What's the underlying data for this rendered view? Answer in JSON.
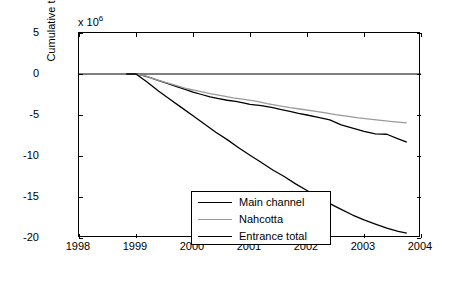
{
  "chart_data": {
    "type": "line",
    "title": "",
    "xlabel": "",
    "ylabel": "Cumulative transport (m",
    "ylabel_sup": "3",
    "ylabel_tail": ")",
    "y_exponent_prefix": "x 10",
    "y_exponent": "6",
    "xlim": [
      1998,
      2004
    ],
    "ylim": [
      -20,
      5
    ],
    "xticks": [
      "1998",
      "1999",
      "2000",
      "2001",
      "2002",
      "2003",
      "2004"
    ],
    "yticks": [
      "5",
      "0",
      "-5",
      "-10",
      "-15",
      "-20"
    ],
    "grid": false,
    "legend_position": "lower-left-inside",
    "series": [
      {
        "name": "Main channel",
        "color": "#000000",
        "x": [
          1998.83,
          1999.0,
          1999.1,
          1999.25,
          1999.4,
          1999.55,
          1999.7,
          1999.85,
          2000.0,
          2000.15,
          2000.3,
          2000.45,
          2000.6,
          2000.75,
          2000.9,
          2001.0,
          2001.2,
          2001.4,
          2001.55,
          2001.7,
          2001.85,
          2002.0,
          2002.2,
          2002.4,
          2002.6,
          2002.8,
          2003.0,
          2003.2,
          2003.4,
          2003.6,
          2003.75
        ],
        "y": [
          0.0,
          0.0,
          -0.15,
          -0.45,
          -0.8,
          -1.15,
          -1.5,
          -1.85,
          -2.2,
          -2.5,
          -2.8,
          -3.0,
          -3.2,
          -3.35,
          -3.55,
          -3.7,
          -3.85,
          -4.1,
          -4.35,
          -4.55,
          -4.8,
          -5.0,
          -5.3,
          -5.6,
          -6.2,
          -6.6,
          -7.0,
          -7.3,
          -7.35,
          -7.9,
          -8.3
        ]
      },
      {
        "name": "Nahcotta",
        "color": "#9a9a9a",
        "x": [
          1998.83,
          1999.0,
          1999.15,
          1999.3,
          1999.5,
          1999.7,
          1999.9,
          2000.1,
          2000.3,
          2000.5,
          2000.7,
          2000.9,
          2001.1,
          2001.3,
          2001.5,
          2001.7,
          2001.9,
          2002.1,
          2002.3,
          2002.5,
          2002.7,
          2002.9,
          2003.1,
          2003.3,
          2003.5,
          2003.75
        ],
        "y": [
          0.0,
          0.0,
          -0.2,
          -0.55,
          -1.0,
          -1.4,
          -1.8,
          -2.1,
          -2.4,
          -2.65,
          -2.9,
          -3.1,
          -3.3,
          -3.6,
          -3.85,
          -4.1,
          -4.3,
          -4.5,
          -4.7,
          -4.95,
          -5.15,
          -5.35,
          -5.5,
          -5.65,
          -5.8,
          -5.95
        ]
      },
      {
        "name": "Entrance total",
        "color": "#000000",
        "x": [
          1998.83,
          1999.0,
          1999.2,
          1999.4,
          1999.6,
          1999.8,
          2000.0,
          2000.2,
          2000.4,
          2000.6,
          2000.8,
          2001.0,
          2001.2,
          2001.4,
          2001.6,
          2001.8,
          2002.0,
          2002.2,
          2002.4,
          2002.6,
          2002.8,
          2003.0,
          2003.2,
          2003.4,
          2003.6,
          2003.75
        ],
        "y": [
          0.0,
          0.0,
          -1.0,
          -2.1,
          -3.1,
          -4.1,
          -5.1,
          -6.1,
          -7.1,
          -8.0,
          -9.0,
          -9.9,
          -10.8,
          -11.7,
          -12.5,
          -13.4,
          -14.2,
          -15.0,
          -15.8,
          -16.5,
          -17.2,
          -17.8,
          -18.3,
          -18.8,
          -19.2,
          -19.4
        ]
      }
    ]
  },
  "legend": {
    "items": [
      {
        "label": "Main channel"
      },
      {
        "label": "Nahcotta"
      },
      {
        "label": "Entrance total"
      }
    ]
  }
}
